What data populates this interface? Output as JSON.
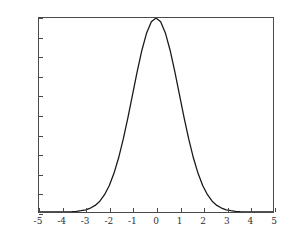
{
  "chart_data": {
    "type": "line",
    "title": "",
    "xlabel": "",
    "ylabel": "",
    "xlim": [
      -5,
      5
    ],
    "ylim": [
      0,
      1
    ],
    "grid": false,
    "legend": null,
    "x_ticks": [
      -5,
      -4,
      -3,
      -2,
      -1,
      0,
      1,
      2,
      3,
      4,
      5
    ],
    "x_tick_labels": [
      "-5",
      "-4",
      "-3",
      "-2",
      "-1",
      "0",
      "1",
      "2",
      "3",
      "4",
      "5"
    ],
    "y_ticks": [
      0,
      0.1,
      0.2,
      0.3,
      0.4,
      0.5,
      0.6,
      0.7,
      0.8,
      0.9,
      1
    ],
    "y_tick_labels": [
      "0",
      "0.1",
      "0.2",
      "0.3",
      "0.4",
      "0.5",
      "0.6",
      "0.7",
      "0.8",
      "0.9",
      "1"
    ],
    "series": [
      {
        "name": "gaussian",
        "color": "#1a1a1a",
        "x": [
          -5,
          -4.8,
          -4.6,
          -4.4,
          -4.2,
          -4,
          -3.8,
          -3.6,
          -3.4,
          -3.2,
          -3,
          -2.8,
          -2.6,
          -2.4,
          -2.2,
          -2,
          -1.8,
          -1.6,
          -1.4,
          -1.2,
          -1,
          -0.8,
          -0.6,
          -0.4,
          -0.2,
          0,
          0.2,
          0.4,
          0.6,
          0.8,
          1,
          1.2,
          1.4,
          1.6,
          1.8,
          2,
          2.2,
          2.4,
          2.6,
          2.8,
          3,
          3.2,
          3.4,
          3.6,
          3.8,
          4,
          4.2,
          4.4,
          4.6,
          4.8,
          5
        ],
        "values": [
          3.7e-06,
          9.8e-06,
          2.49e-05,
          6.11e-05,
          0.000145,
          0.000335,
          0.000748,
          0.001616,
          0.00337,
          0.006792,
          0.011109,
          0.020294,
          0.034047,
          0.055576,
          0.088922,
          0.135335,
          0.197899,
          0.278037,
          0.375311,
          0.486752,
          0.606531,
          0.726149,
          0.83527,
          0.923116,
          0.980199,
          1.0,
          0.980199,
          0.923116,
          0.83527,
          0.726149,
          0.606531,
          0.486752,
          0.375311,
          0.278037,
          0.197899,
          0.135335,
          0.088922,
          0.055576,
          0.034047,
          0.020294,
          0.011109,
          0.006792,
          0.00337,
          0.001616,
          0.000748,
          0.000335,
          0.000145,
          6.11e-05,
          2.49e-05,
          9.8e-06,
          3.7e-06
        ]
      }
    ]
  },
  "style": {
    "frame_color": "#4a4a4a",
    "curve_color": "#1a1a1a",
    "label_color": "#303030",
    "background": "#ffffff"
  }
}
